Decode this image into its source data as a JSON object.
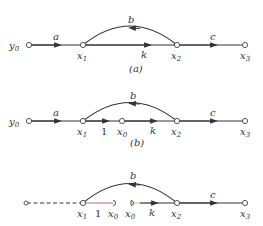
{
  "diagrams": [
    {
      "id": "a",
      "caption": "(a)",
      "nodes": [
        {
          "name": "y",
          "sub": "0",
          "label": "y0"
        },
        {
          "name": "x",
          "sub": "1",
          "label": "x1"
        },
        {
          "name": "x",
          "sub": "2",
          "label": "x2"
        },
        {
          "name": "x",
          "sub": "3",
          "label": "x3"
        }
      ],
      "edges": [
        {
          "from": "y0",
          "to": "x1",
          "gain": "a"
        },
        {
          "from": "x1",
          "to": "x2",
          "gain": "k"
        },
        {
          "from": "x2",
          "to": "x1",
          "gain": "b",
          "shape": "arc"
        },
        {
          "from": "x2",
          "to": "x3",
          "gain": "c"
        }
      ]
    },
    {
      "id": "b",
      "caption": "(b)",
      "nodes": [
        {
          "name": "y",
          "sub": "0",
          "label": "y0"
        },
        {
          "name": "x",
          "sub": "1",
          "label": "x1"
        },
        {
          "name": "x",
          "sub": "0",
          "label": "x0"
        },
        {
          "name": "x",
          "sub": "2",
          "label": "x2"
        },
        {
          "name": "x",
          "sub": "3",
          "label": "x3"
        }
      ],
      "edges": [
        {
          "from": "y0",
          "to": "x1",
          "gain": "a"
        },
        {
          "from": "x1",
          "to": "x0",
          "gain": "1"
        },
        {
          "from": "x0",
          "to": "x2",
          "gain": "k"
        },
        {
          "from": "x2",
          "to": "x1",
          "gain": "b",
          "shape": "arc"
        },
        {
          "from": "x2",
          "to": "x3",
          "gain": "c"
        }
      ]
    },
    {
      "id": "c",
      "caption": "",
      "nodes": [
        {
          "name": "x",
          "sub": "1",
          "label": "x1"
        },
        {
          "name": "x",
          "sub": "0",
          "label": "x0 (sink)"
        },
        {
          "name": "x",
          "sub": "0",
          "label": "x0 (source)"
        },
        {
          "name": "x",
          "sub": "2",
          "label": "x2"
        },
        {
          "name": "x",
          "sub": "3",
          "label": "x3"
        }
      ],
      "edges": [
        {
          "from": "input",
          "to": "x1",
          "gain": "",
          "style": "dashed"
        },
        {
          "from": "x1",
          "to": "x0",
          "gain": "1"
        },
        {
          "from": "x0",
          "to": "x2",
          "gain": "k"
        },
        {
          "from": "x2",
          "to": "x1",
          "gain": "b",
          "shape": "arc"
        },
        {
          "from": "x2",
          "to": "x3",
          "gain": "c"
        }
      ]
    }
  ],
  "labels": {
    "a": {
      "y0_name": "y",
      "y0_sub": "0",
      "x1_name": "x",
      "x1_sub": "1",
      "x2_name": "x",
      "x2_sub": "2",
      "x3_name": "x",
      "x3_sub": "3",
      "gain_a": "a",
      "gain_k": "k",
      "gain_b": "b",
      "gain_c": "c",
      "caption": "(a)"
    },
    "b": {
      "y0_name": "y",
      "y0_sub": "0",
      "x1_name": "x",
      "x1_sub": "1",
      "x0_name": "x",
      "x0_sub": "0",
      "x2_name": "x",
      "x2_sub": "2",
      "x3_name": "x",
      "x3_sub": "3",
      "gain_a": "a",
      "gain_1": "1",
      "gain_k": "k",
      "gain_b": "b",
      "gain_c": "c",
      "caption": "(b)"
    },
    "c": {
      "x1_name": "x",
      "x1_sub": "1",
      "x0a_name": "x",
      "x0a_sub": "0",
      "x0b_name": "x",
      "x0b_sub": "0",
      "x2_name": "x",
      "x2_sub": "2",
      "x3_name": "x",
      "x3_sub": "3",
      "gain_1": "1",
      "gain_k": "k",
      "gain_b": "b",
      "gain_c": "c"
    }
  },
  "colors": {
    "stroke": "#333333",
    "split_edge_left": "#c08080",
    "split_edge_right": "#c8d080"
  }
}
